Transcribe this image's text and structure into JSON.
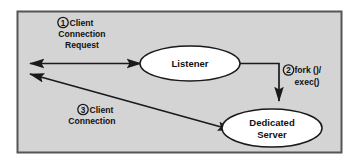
{
  "figure": {
    "frame": {
      "background_color": "#d4d4d4",
      "border_color": "#555555",
      "outer_background": "#ffffff"
    },
    "line_color": "#1a1a1a",
    "node_fill": "#ffffff"
  },
  "nodes": [
    {
      "id": "listener",
      "label": "Listener",
      "shape": "ellipse"
    },
    {
      "id": "dedicated-server",
      "label_line1": "Dedicated",
      "label_line2": "Server",
      "shape": "ellipse"
    }
  ],
  "steps": [
    {
      "number": "1",
      "line1": "Client",
      "line2": "Connection",
      "line3": "Request"
    },
    {
      "number": "2",
      "line1": "fork ()/",
      "line2": "exec()"
    },
    {
      "number": "3",
      "line1": "Client",
      "line2": "Connection"
    }
  ],
  "connections": [
    {
      "id": "client-listener",
      "from": "client",
      "to": "listener",
      "style": "double-arrow",
      "step": "1"
    },
    {
      "id": "listener-dedicated",
      "from": "listener",
      "to": "dedicated-server",
      "style": "elbow-arrow",
      "step": "2"
    },
    {
      "id": "client-dedicated",
      "from": "dedicated-server",
      "to": "client",
      "style": "double-arrow-diagonal",
      "step": "3"
    }
  ]
}
